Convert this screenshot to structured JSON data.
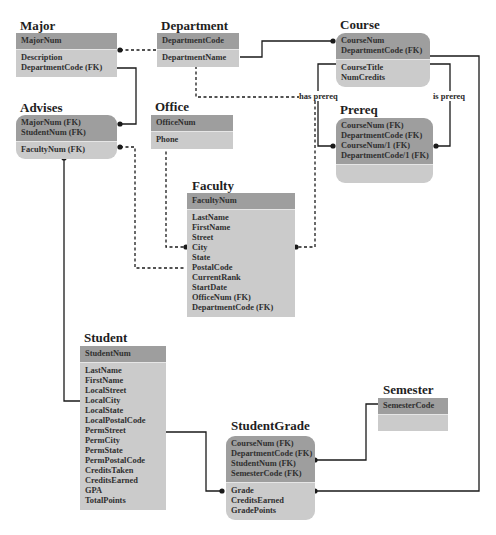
{
  "diagram": {
    "entities": {
      "major": {
        "title": "Major",
        "pk": [
          "MajorNum"
        ],
        "attrs": [
          "Description",
          "DepartmentCode (FK)"
        ]
      },
      "department": {
        "title": "Department",
        "pk": [
          "DepartmentCode"
        ],
        "attrs": [
          "DepartmentName"
        ]
      },
      "course": {
        "title": "Course",
        "pk": [
          "CourseNum",
          "DepartmentCode (FK)"
        ],
        "attrs": [
          "CourseTitle",
          "NumCredits"
        ]
      },
      "advises": {
        "title": "Advises",
        "pk": [
          "MajorNum (FK)",
          "StudentNum (FK)"
        ],
        "attrs": [
          "FacultyNum (FK)"
        ]
      },
      "office": {
        "title": "Office",
        "pk": [
          "OfficeNum"
        ],
        "attrs": [
          "Phone"
        ]
      },
      "prereq": {
        "title": "Prereq",
        "pk": [
          "CourseNum (FK)",
          "DepartmentCode (FK)",
          "CourseNum/1 (FK)",
          "DepartmentCode/1 (FK)"
        ],
        "attrs": []
      },
      "faculty": {
        "title": "Faculty",
        "pk": [
          "FacultyNum"
        ],
        "attrs": [
          "LastName",
          "FirstName",
          "Street",
          "City",
          "State",
          "PostalCode",
          "CurrentRank",
          "StartDate",
          "OfficeNum (FK)",
          "DepartmentCode (FK)"
        ]
      },
      "student": {
        "title": "Student",
        "pk": [
          "StudentNum"
        ],
        "attrs": [
          "LastName",
          "FirstName",
          "LocalStreet",
          "LocalCity",
          "LocalState",
          "LocalPostalCode",
          "PermStreet",
          "PermCity",
          "PermState",
          "PermPostalCode",
          "CreditsTaken",
          "CreditsEarned",
          "GPA",
          "TotalPoints"
        ]
      },
      "semester": {
        "title": "Semester",
        "pk": [
          "SemesterCode"
        ],
        "attrs": []
      },
      "studentgrade": {
        "title": "StudentGrade",
        "pk": [
          "CourseNum (FK)",
          "DepartmentCode (FK)",
          "StudentNum (FK)",
          "SemesterCode (FK)"
        ],
        "attrs": [
          "Grade",
          "CreditsEarned",
          "GradePoints"
        ]
      }
    },
    "relationship_labels": {
      "has_prereq": "has prereq",
      "is_prereq": "is prereq"
    },
    "colors": {
      "pk_fill": "#9e9e9e",
      "attr_fill": "#cbcbcb",
      "line": "#1a1a1a"
    }
  }
}
